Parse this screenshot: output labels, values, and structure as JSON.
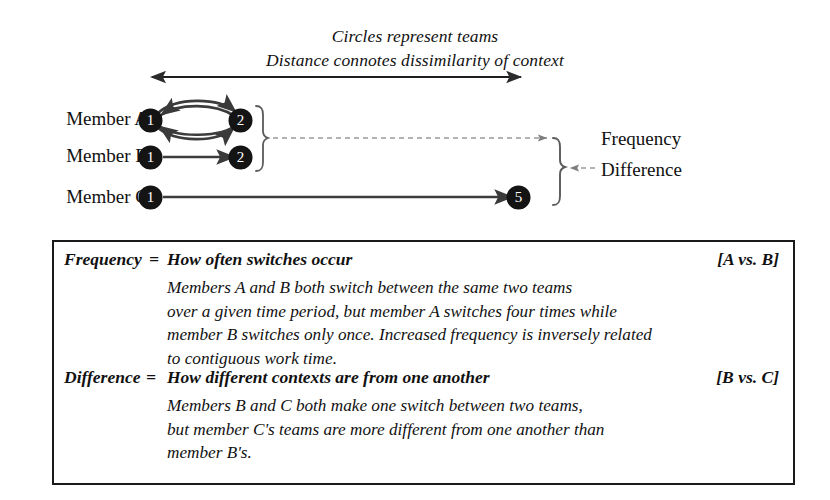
{
  "caption": {
    "line1": "Circles represent teams",
    "line2": "Distance connotes dissimilarity of context"
  },
  "diagram": {
    "axis_arrow_name": "distance-axis-double-arrow",
    "rows": [
      {
        "label": "Member A",
        "nodes": [
          {
            "value": "1",
            "x": 150,
            "y": 120
          },
          {
            "value": "2",
            "x": 240,
            "y": 120
          }
        ],
        "switches": 4,
        "edge_style": "four-curved-arrows"
      },
      {
        "label": "Member B",
        "nodes": [
          {
            "value": "1",
            "x": 150,
            "y": 157
          },
          {
            "value": "2",
            "x": 240,
            "y": 157
          }
        ],
        "switches": 1,
        "edge_style": "single-straight-arrow"
      },
      {
        "label": "Member C",
        "nodes": [
          {
            "value": "1",
            "x": 150,
            "y": 197
          },
          {
            "value": "5",
            "x": 518,
            "y": 197
          }
        ],
        "switches": 1,
        "edge_style": "single-straight-arrow"
      }
    ],
    "callouts": [
      {
        "label": "Frequency",
        "brace": "inner-brace-members-a-b"
      },
      {
        "label": "Difference",
        "brace": "outer-brace-members-b-c"
      }
    ]
  },
  "definitions": [
    {
      "term": "Frequency",
      "equals": "=",
      "description": "How often switches occur",
      "comparison": "[A vs. B]",
      "body": [
        "Members A and B both switch between the same two teams",
        "over a given time period, but member A switches four times while",
        "member B switches only once. Increased frequency is inversely related",
        "to contiguous work time."
      ]
    },
    {
      "term": "Difference",
      "equals": "=",
      "description": "How different contexts are from one another",
      "comparison": "[B vs. C]",
      "body": [
        "Members B and C both make one switch between two teams,",
        "but member C's teams are more different from one another than",
        "member B's."
      ]
    }
  ],
  "colors": {
    "ink": "#141414",
    "page": "#ffffff",
    "leader": "#8a8a8a"
  }
}
